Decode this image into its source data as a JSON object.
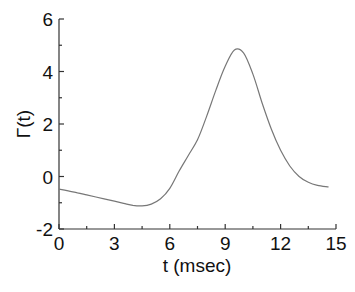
{
  "chart_data": {
    "type": "line",
    "title": "",
    "xlabel": "t (msec)",
    "ylabel": "Γ(t)",
    "xlim": [
      0,
      15
    ],
    "ylim": [
      -2,
      6
    ],
    "xticks": [
      0,
      3,
      6,
      9,
      12,
      15
    ],
    "yticks": [
      -2,
      0,
      2,
      4,
      6
    ],
    "grid": false,
    "legend": null,
    "series": [
      {
        "name": "Γ(t)",
        "color": "#777777",
        "x": [
          0,
          0.5,
          1,
          1.5,
          2,
          2.5,
          3,
          3.5,
          4,
          4.5,
          5,
          5.5,
          6,
          6.5,
          7,
          7.5,
          8,
          8.5,
          9,
          9.5,
          10,
          10.5,
          11,
          11.5,
          12,
          12.5,
          13,
          13.5,
          14,
          14.6
        ],
        "y": [
          -0.48,
          -0.55,
          -0.62,
          -0.7,
          -0.78,
          -0.86,
          -0.94,
          -1.02,
          -1.1,
          -1.12,
          -1.05,
          -0.85,
          -0.45,
          0.2,
          0.8,
          1.4,
          2.3,
          3.3,
          4.2,
          4.82,
          4.7,
          3.9,
          2.8,
          1.8,
          1.0,
          0.4,
          0.0,
          -0.22,
          -0.34,
          -0.4
        ]
      }
    ]
  }
}
